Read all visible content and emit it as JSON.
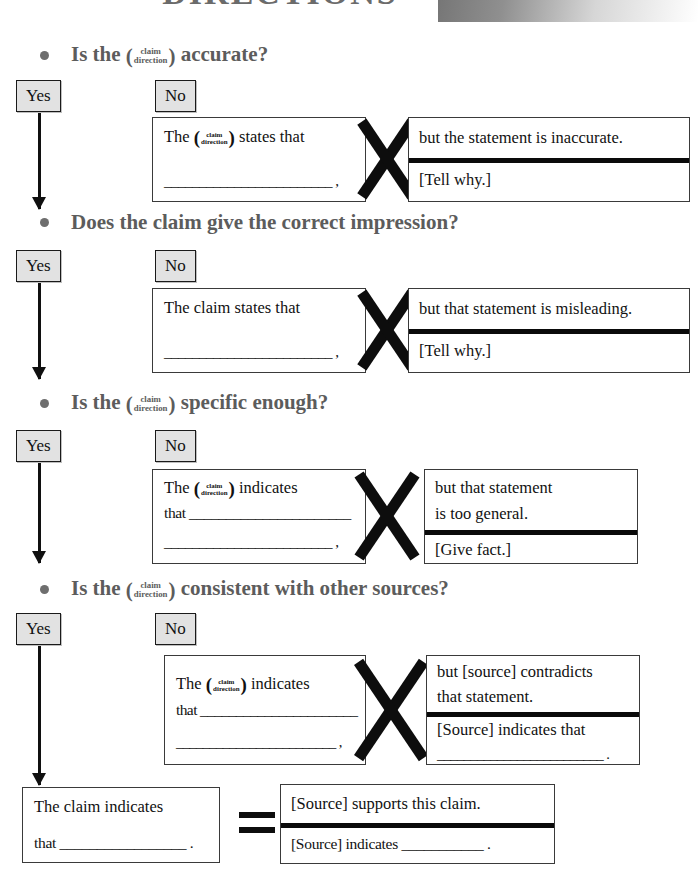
{
  "document": {
    "title": "DIRECTIONS",
    "fraction": {
      "top": "claim",
      "bottom": "direction"
    },
    "paren_open": "(",
    "paren_close": ")",
    "yes_label": "Yes",
    "no_label": "No",
    "x_operator": "×",
    "equals_operator": "="
  },
  "steps": [
    {
      "question_prefix": "Is the ",
      "question_suffix": " accurate?",
      "uses_fraction": true,
      "left_box": {
        "line1_prefix": "The ",
        "line1_suffix": " states that",
        "uses_fraction": true,
        "line2": "________________________ ,"
      },
      "right_box": {
        "top": [
          "but the statement is inaccurate."
        ],
        "bottom": [
          "[Tell why.]"
        ]
      }
    },
    {
      "question_prefix": "Does the claim give the correct impression?",
      "question_suffix": "",
      "uses_fraction": false,
      "left_box": {
        "line1_prefix": "The claim states that",
        "line1_suffix": "",
        "uses_fraction": false,
        "line2": "________________________ ,"
      },
      "right_box": {
        "top": [
          "but that statement is misleading."
        ],
        "bottom": [
          "[Tell why.]"
        ]
      }
    },
    {
      "question_prefix": "Is the ",
      "question_suffix": " specific enough?",
      "uses_fraction": true,
      "left_box": {
        "line1_prefix": "The ",
        "line1_suffix": " indicates",
        "uses_fraction": true,
        "line1b": "that ______________________",
        "line2": "________________________ ,"
      },
      "right_box": {
        "top": [
          "but that statement",
          "is too general."
        ],
        "bottom": [
          "[Give fact.]"
        ]
      }
    },
    {
      "question_prefix": "Is the ",
      "question_suffix": " consistent with other sources?",
      "uses_fraction": true,
      "left_box": {
        "line1_prefix": "The ",
        "line1_suffix": " indicates",
        "uses_fraction": true,
        "line1b": "that ______________________",
        "line2": "________________________ ,"
      },
      "right_box": {
        "top": [
          "but [source] contradicts",
          "that statement."
        ],
        "bottom": [
          "[Source] indicates that",
          "_________________________ ."
        ]
      }
    }
  ],
  "final": {
    "left_box": {
      "line1": "The claim indicates",
      "line2": "that _________________ ."
    },
    "right_box": {
      "top": [
        "[Source] supports this claim."
      ],
      "bottom": [
        "[Source] indicates ___________ ."
      ]
    }
  },
  "colors": {
    "heading": "#5c5c5c",
    "chip_fill": "#e2e2e2",
    "ink": "#101010",
    "box_border": "#3a3a3a"
  }
}
